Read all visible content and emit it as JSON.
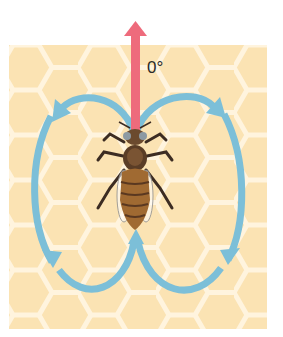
{
  "diagram": {
    "direction_label": "0°",
    "elements": {
      "background": "honeycomb",
      "direction_arrow": "straight-up",
      "return_loops": [
        "left-loop",
        "right-loop"
      ]
    },
    "colors": {
      "honeycomb_fill": "#fbe3b3",
      "honeycomb_lines": "#fff3dc",
      "loop_arrow": "#7cbfd8",
      "direction_arrow": "#ee6b7c",
      "bee_body": "#a06a32",
      "bee_dark": "#3c2c22"
    }
  }
}
